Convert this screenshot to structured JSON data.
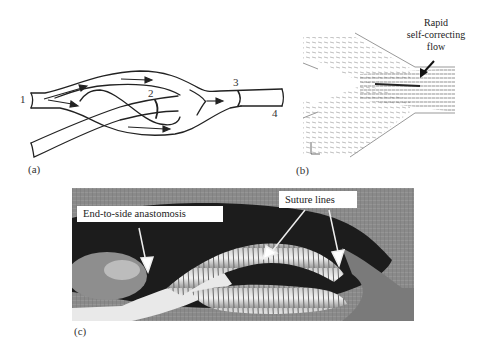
{
  "figure": {
    "panel_a": {
      "label": "(a)",
      "description": "Schematic of bifurcating vessel graft with flow arrows",
      "markers": [
        {
          "id": "1",
          "text": "1"
        },
        {
          "id": "2",
          "text": "2"
        },
        {
          "id": "3",
          "text": "3"
        },
        {
          "id": "4",
          "text": "4"
        }
      ]
    },
    "panel_b": {
      "label": "(b)",
      "description": "Velocity vector field at vessel junction",
      "annotation": {
        "line1": "Rapid",
        "line2": "self-correcting",
        "line3": "flow"
      },
      "axis_marker_x": "x",
      "axis_marker_y": "y"
    },
    "panel_c": {
      "label": "(c)",
      "description": "Surgical photograph of graft",
      "callouts": {
        "anastomosis": "End-to-side anastomosis",
        "suture": "Suture lines"
      }
    },
    "colors": {
      "ink": "#222222",
      "background": "#ffffff",
      "photo_dark": "#1e1e1e",
      "photo_mid": "#707070",
      "photo_light": "#e8e8e8"
    }
  }
}
